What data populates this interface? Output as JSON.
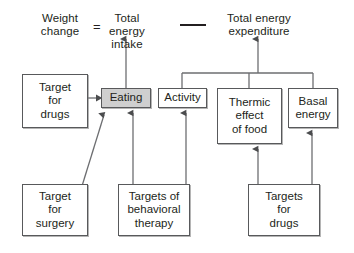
{
  "diagram": {
    "equation": {
      "left_label": "Weight\nchange",
      "equals_sign": "=",
      "intake_label": "Total energy\nintake",
      "minus_sign": "—",
      "expenditure_label": "Total energy\nexpenditure"
    },
    "nodes": [
      {
        "id": "target-for-drugs-left",
        "label": "Target\nfor\ndrugs",
        "shaded": false,
        "x": 22,
        "y": 74,
        "w": 66,
        "h": 54
      },
      {
        "id": "eating",
        "label": "Eating",
        "shaded": true,
        "x": 101,
        "y": 88,
        "w": 50,
        "h": 20
      },
      {
        "id": "activity",
        "label": "Activity",
        "shaded": false,
        "x": 158,
        "y": 88,
        "w": 49,
        "h": 20
      },
      {
        "id": "thermic-effect-of-food",
        "label": "Thermic\neffect\nof food",
        "shaded": false,
        "x": 217,
        "y": 88,
        "w": 65,
        "h": 56
      },
      {
        "id": "basal-energy",
        "label": "Basal\nenergy",
        "shaded": false,
        "x": 288,
        "y": 88,
        "w": 50,
        "h": 40
      },
      {
        "id": "target-for-surgery",
        "label": "Target\nfor\nsurgery",
        "shaded": false,
        "x": 22,
        "y": 184,
        "w": 66,
        "h": 52
      },
      {
        "id": "targets-of-behavioral-therapy",
        "label": "Targets of\nbehavioral\ntherapy",
        "shaded": false,
        "x": 118,
        "y": 184,
        "w": 72,
        "h": 52
      },
      {
        "id": "target-for-drugs-bottom",
        "label": "Targets\nfor\ndrugs",
        "shaded": false,
        "x": 248,
        "y": 184,
        "w": 72,
        "h": 52
      }
    ],
    "edges": [
      {
        "from": "eating",
        "to": "total-energy-intake",
        "style": "vertical-arrow"
      },
      {
        "from": "expenditure-bracket",
        "to": "total-energy-expenditure",
        "style": "vertical-arrow"
      },
      {
        "from": "expenditure-bracket",
        "to": "activity",
        "style": "bracket-drop"
      },
      {
        "from": "expenditure-bracket",
        "to": "thermic-effect-of-food",
        "style": "bracket-drop"
      },
      {
        "from": "expenditure-bracket",
        "to": "basal-energy",
        "style": "bracket-drop"
      },
      {
        "from": "target-for-drugs-left",
        "to": "eating",
        "style": "horizontal-arrow"
      },
      {
        "from": "target-for-surgery",
        "to": "eating",
        "style": "diagonal-arrow"
      },
      {
        "from": "targets-of-behavioral-therapy",
        "to": "eating",
        "style": "vertical-arrow"
      },
      {
        "from": "targets-of-behavioral-therapy",
        "to": "activity",
        "style": "vertical-arrow"
      },
      {
        "from": "target-for-drugs-bottom",
        "to": "thermic-effect-of-food",
        "style": "vertical-arrow"
      },
      {
        "from": "target-for-drugs-bottom",
        "to": "basal-energy",
        "style": "vertical-arrow"
      }
    ],
    "colors": {
      "background": "#ffffff",
      "box_border": "#58595b",
      "box_fill": "#ffffff",
      "shaded_fill": "#cfcfcf",
      "line": "#6d6e71",
      "text": "#231f20"
    }
  }
}
